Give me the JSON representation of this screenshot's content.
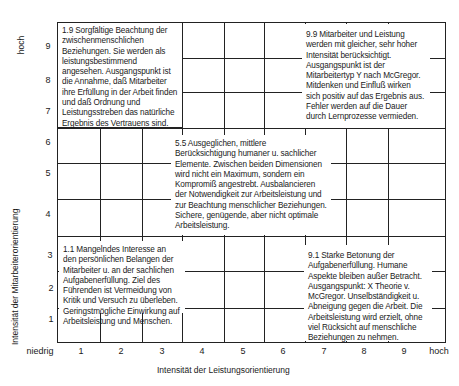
{
  "diagram": {
    "type": "managerial-grid",
    "title": "",
    "x_axis": {
      "label": "Intensität der Leistungsorientierung",
      "low_label": "niedrig",
      "high_label": "hoch",
      "ticks": [
        "1",
        "2",
        "3",
        "4",
        "5",
        "6",
        "7",
        "8",
        "9"
      ]
    },
    "y_axis": {
      "label": "Intensität der Mitarbeiterorientierung",
      "high_label": "hoch",
      "ticks": [
        "9",
        "8",
        "7",
        "6",
        "5",
        "4",
        "3",
        "2",
        "1"
      ]
    },
    "styles": {
      "s19": "1.9 Sorgfältige Beachtung der zwischenmenschlichen Beziehungen. Sie werden als leistungsbestimmend angesehen. Ausgangspunkt ist die Annahme, daß Mitarbeiter ihre Erfüllung in der Arbeit finden und daß Ordnung und Leistungsstreben das natürliche Ergebnis des Vertrauens sind.",
      "s99": "9.9 Mitarbeiter und Leistung werden mit gleicher, sehr hoher Intensität berücksichtigt. Ausgangspunkt ist der Mitarbeitertyp Y nach McGregor. Mitdenken und Einfluß wirken sich positiv auf das Ergebnis aus. Fehler werden auf die Dauer durch Lernprozesse vermieden.",
      "s55": "5.5 Ausgeglichen, mittlere Berücksichtigung humaner u. sachlicher Elemente. Zwischen beiden Dimensionen wird nicht ein Maximum, sondern ein Kompromiß angestrebt. Ausbalancieren der Notwendigkeit zur Arbeitsleistung und zur Beachtung menschlicher Beziehungen. Sichere, genügende, aber nicht optimale Arbeitsleistung.",
      "s11": "1.1 Mangelndes Interesse an den persönlichen Belangen der Mitarbeiter u. an der sachlichen Aufgabenerfüllung. Ziel des Führenden ist Vermeidung von Kritik und Versuch zu überleben. Geringstmögliche Einwirkung auf Arbeitsleistung und Menschen.",
      "s91": "9.1 Starke Betonung der Aufgabenerfüllung. Humane Aspekte bleiben außer Betracht. Ausgangspunkt: X Theorie v. McGregor. Unselbständigkeit u. Abneigung gegen die Arbeit. Die Arbeitsleistung wird erzielt, ohne viel Rücksicht auf menschliche Beziehungen zu nehmen."
    }
  }
}
